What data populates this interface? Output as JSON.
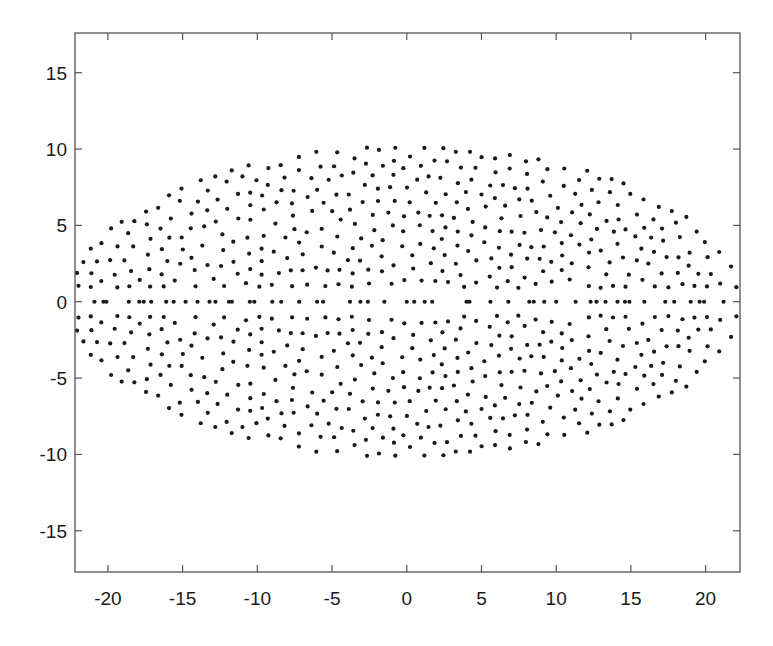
{
  "chart_data": {
    "type": "scatter",
    "title": "",
    "xlabel": "",
    "ylabel": "",
    "xlim": [
      -22.2,
      22.3
    ],
    "ylim": [
      -17.7,
      17.6
    ],
    "grid": false,
    "legend": null,
    "x_ticks": [
      -20,
      -15,
      -10,
      -5,
      0,
      5,
      10,
      15,
      20
    ],
    "x_tick_labels": [
      "-20",
      "-15",
      "-10",
      "-5",
      "0",
      "5",
      "10",
      "15",
      "20"
    ],
    "y_ticks": [
      -15,
      -10,
      -5,
      0,
      5,
      10,
      15
    ],
    "y_tick_labels": [
      "-15",
      "-10",
      "-5",
      "0",
      "5",
      "10",
      "15"
    ],
    "marker": {
      "shape": "circle",
      "radius_px": 2.1,
      "color": "#1a1a1a"
    },
    "series": [
      {
        "name": "points",
        "description": "Filled elliptical cloud of ~1000 points, symmetric about y=0, with a row of points on y=0",
        "region": {
          "shape": "ellipse",
          "center": [
            0,
            0
          ],
          "semi_axis_x": 22.5,
          "semi_axis_y": 10.2
        },
        "mirror_about_y0": true,
        "half_point_count": 470,
        "seed": 12345,
        "y0_row_x": [
          -20.9,
          -20.3,
          -20.1,
          -18.6,
          -17.9,
          -17.6,
          -17.1,
          -16.1,
          -15.6,
          -14.8,
          -14.0,
          -13.2,
          -12.8,
          -11.9,
          -11.7,
          -10.5,
          -10.2,
          -9.0,
          -8.4,
          -7.2,
          -6.0,
          -5.6,
          -3.8,
          -3.1,
          -2.6,
          -1.5,
          0.0,
          0.5,
          1.2,
          1.7,
          4.0,
          4.2,
          5.6,
          6.8,
          8.2,
          8.5,
          9.2,
          10.0,
          11.3,
          12.3,
          12.7,
          13.3,
          14.1,
          14.6,
          14.9,
          15.9,
          17.3,
          17.9,
          19.0,
          19.6,
          19.9,
          21.2
        ]
      }
    ]
  },
  "axes_box": {
    "left": 75,
    "top": 33,
    "right": 740,
    "bottom": 572
  },
  "colors": {
    "axis": "#555555",
    "marker": "#1a1a1a",
    "background": "#ffffff",
    "text": "#1a1a1a"
  }
}
